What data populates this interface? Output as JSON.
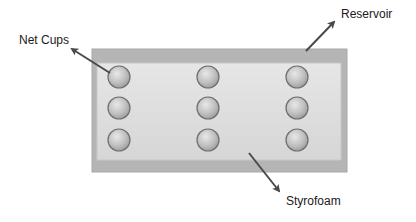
{
  "diagram": {
    "labels": {
      "net_cups": "Net Cups",
      "reservoir": "Reservoir",
      "styrofoam": "Styrofoam"
    },
    "grid": {
      "rows": 3,
      "columns": 3
    },
    "colors": {
      "reservoir_border": "#b0b0b0",
      "styrofoam_fill": "#dcdcdc",
      "cup_fill": "#c4c4c4",
      "cup_stroke": "#6e6e6e",
      "arrow": "#4a4a4a"
    }
  }
}
